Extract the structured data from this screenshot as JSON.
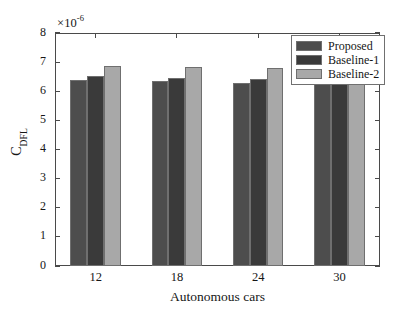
{
  "chart_data": {
    "type": "bar",
    "title": "",
    "xlabel": "Autonomous cars",
    "ylabel": "C_DFL",
    "ylabel_base": "C",
    "ylabel_sub": "DFL",
    "exponent_prefix": "×10",
    "exponent_power": "-6",
    "exponent_label": "×10⁻⁶",
    "categories": [
      "12",
      "18",
      "24",
      "30"
    ],
    "ylim": [
      0,
      8
    ],
    "ytick_labels": [
      "0",
      "1",
      "2",
      "3",
      "4",
      "5",
      "6",
      "7",
      "8"
    ],
    "ytick_values": [
      0,
      1,
      2,
      3,
      4,
      5,
      6,
      7,
      8
    ],
    "grid": false,
    "legend_position": "top-right",
    "scale_factor": "1e-6",
    "series": [
      {
        "name": "Proposed",
        "color": "#4d4d4d",
        "values": [
          6.4,
          6.35,
          6.28,
          6.24
        ]
      },
      {
        "name": "Baseline-1",
        "color": "#3a3a3a",
        "values": [
          6.52,
          6.47,
          6.42,
          6.36
        ]
      },
      {
        "name": "Baseline-2",
        "color": "#a8a8a8",
        "values": [
          6.88,
          6.84,
          6.79,
          6.98
        ]
      }
    ]
  },
  "colors": {
    "axis": "#4a4a4a",
    "text": "#161616",
    "background": "#ffffff",
    "bar_edge": "#6f6f6f",
    "legend_border": "#707070"
  }
}
